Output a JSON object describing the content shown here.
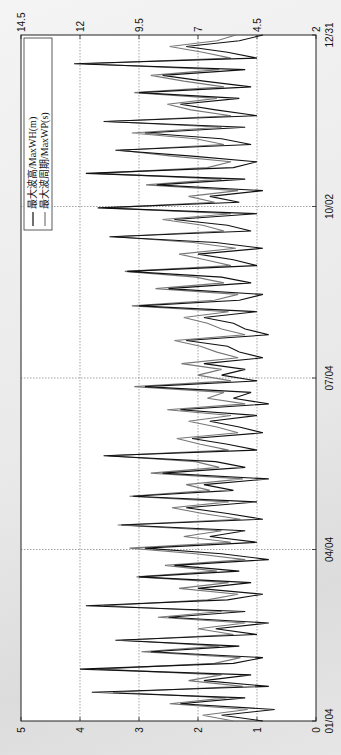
{
  "chart_data": {
    "type": "line",
    "orientation": "rotated-90-clockwise",
    "title": "",
    "xlabel": "",
    "ylabel_left": "",
    "ylabel_right": "",
    "x_tick_labels": [
      "01/04",
      "04/04",
      "07/04",
      "10/02",
      "12/31"
    ],
    "y_left_ticks": [
      0,
      1,
      2,
      3,
      4,
      5
    ],
    "y_left_ylim": [
      0,
      5
    ],
    "y_right_ticks": [
      2,
      4.5,
      7,
      9.5,
      12,
      14.5
    ],
    "y_right_ylim": [
      2,
      14.5
    ],
    "grid": true,
    "legend_position": "upper-left (rotated)",
    "legend": [
      "最大波高/MaxWH(m)",
      "最大波周期/MaxWP(s)"
    ],
    "series": [
      {
        "name": "最大波高/MaxWH(m)",
        "axis": "left",
        "color": "#111111",
        "values": [
          0.9,
          1.6,
          0.7,
          2.3,
          1.2,
          3.8,
          0.8,
          1.9,
          1.1,
          4.0,
          1.4,
          0.9,
          2.8,
          1.3,
          3.4,
          1.0,
          1.7,
          0.8,
          2.5,
          1.2,
          3.9,
          1.5,
          0.9,
          2.0,
          1.1,
          3.0,
          1.3,
          2.4,
          0.8,
          1.6,
          2.9,
          1.0,
          1.8,
          1.2,
          3.3,
          0.9,
          1.5,
          2.2,
          1.0,
          3.1,
          1.4,
          1.9,
          0.8,
          2.6,
          1.2,
          1.7,
          3.6,
          1.0,
          1.5,
          2.1,
          0.9,
          1.3,
          1.8,
          1.0,
          2.3,
          0.8,
          1.4,
          1.1,
          2.9,
          1.0,
          1.6,
          1.2,
          1.9,
          0.9,
          1.3,
          1.5,
          2.2,
          0.8,
          1.2,
          1.4,
          1.9,
          1.0,
          3.0,
          1.3,
          0.9,
          2.5,
          1.1,
          1.6,
          3.2,
          1.0,
          1.4,
          2.0,
          0.9,
          1.7,
          3.5,
          1.1,
          1.5,
          2.4,
          1.0,
          3.7,
          1.3,
          1.8,
          0.9,
          2.7,
          1.2,
          3.9,
          1.4,
          1.0,
          2.1,
          3.4,
          1.1,
          1.6,
          2.9,
          1.2,
          3.6,
          1.0,
          1.7,
          2.3,
          1.3,
          3.0,
          1.1,
          1.9,
          2.6,
          1.2,
          4.1,
          1.0,
          1.5,
          2.2,
          1.3,
          0.9
        ],
        "sampling": "120 evenly spaced samples over 01/04–12/31"
      },
      {
        "name": "最大波周期/MaxWP(s)",
        "axis": "right",
        "color": "#777777",
        "values": [
          5.5,
          6.8,
          4.9,
          8.2,
          5.8,
          10.6,
          5.1,
          7.4,
          6.0,
          11.2,
          6.3,
          5.2,
          9.4,
          6.1,
          10.2,
          5.5,
          7.0,
          5.0,
          8.7,
          6.0,
          11.0,
          6.6,
          5.3,
          7.8,
          5.7,
          9.6,
          6.2,
          8.4,
          5.0,
          7.1,
          9.9,
          5.6,
          7.6,
          6.0,
          10.4,
          5.2,
          6.8,
          8.1,
          5.7,
          9.9,
          6.5,
          7.5,
          5.1,
          9.0,
          6.1,
          7.1,
          10.8,
          5.7,
          6.9,
          7.9,
          5.3,
          6.2,
          7.4,
          5.6,
          8.3,
          5.0,
          6.6,
          5.9,
          9.7,
          5.6,
          7.0,
          6.0,
          7.7,
          5.3,
          6.2,
          6.9,
          8.0,
          5.0,
          6.0,
          6.6,
          7.6,
          5.7,
          9.8,
          6.3,
          5.3,
          8.8,
          5.9,
          7.1,
          10.1,
          5.6,
          6.7,
          7.8,
          5.4,
          7.2,
          10.5,
          5.9,
          6.8,
          8.5,
          5.6,
          10.9,
          6.3,
          7.4,
          5.3,
          9.2,
          6.0,
          11.3,
          6.6,
          5.6,
          8.1,
          10.3,
          5.9,
          7.1,
          9.8,
          6.0,
          10.8,
          5.6,
          7.3,
          8.3,
          6.2,
          9.7,
          5.9,
          7.6,
          9.0,
          6.1,
          11.8,
          5.6,
          6.8,
          8.2,
          6.2,
          5.4
        ],
        "sampling": "120 evenly spaced samples over 01/04–12/31"
      }
    ]
  },
  "legend": {
    "item_1": "最大波高/MaxWH(m)",
    "item_2": "最大波周期/MaxWP(s)"
  },
  "colors": {
    "wh_line": "#111111",
    "wp_line": "#777777",
    "grid": "#555555",
    "plot_bg": "#ffffff"
  }
}
